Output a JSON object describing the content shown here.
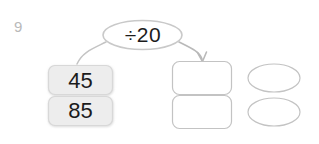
{
  "page": {
    "width": 319,
    "height": 144,
    "background": "#ffffff",
    "question_number": "9"
  },
  "operation": {
    "label": "÷20",
    "shape": "ellipse",
    "name": "divide-by-20",
    "outline_color": "#c9c9c9"
  },
  "inputs": {
    "name": "input-number-boxes",
    "fill": "#ededed",
    "border": "#d6d6d6",
    "items": [
      {
        "value": "45"
      },
      {
        "value": "85"
      }
    ]
  },
  "outputs": {
    "name": "answer-boxes",
    "fill": "#ffffff",
    "border": "#c3c3c3",
    "boxes": [
      {
        "value": ""
      },
      {
        "value": ""
      }
    ],
    "ovals": [
      {
        "value": ""
      },
      {
        "value": ""
      }
    ]
  },
  "connectors": {
    "left_curve": "no-arrowhead",
    "right_curve": "arrowhead",
    "stroke": "#c4c4c4"
  }
}
